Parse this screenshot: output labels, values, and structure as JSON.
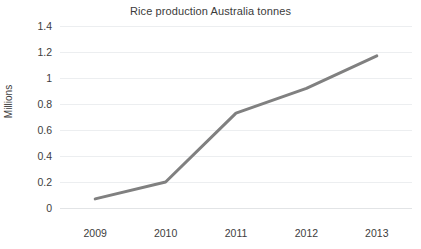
{
  "chart_data": {
    "type": "line",
    "title": "Rice production Australia tonnes",
    "xlabel": "",
    "ylabel": "Millions",
    "categories": [
      "2009",
      "2010",
      "2011",
      "2012",
      "2013"
    ],
    "values": [
      0.07,
      0.2,
      0.73,
      0.92,
      1.17
    ],
    "series": [
      {
        "name": "Rice production Australia tonnes",
        "values": [
          0.07,
          0.2,
          0.73,
          0.92,
          1.17
        ]
      }
    ],
    "ylim": [
      0,
      1.4
    ],
    "y_ticks": [
      "0",
      "0.2",
      "0.4",
      "0.6",
      "0.8",
      "1",
      "1.2",
      "1.4"
    ],
    "y_tick_values": [
      0,
      0.2,
      0.4,
      0.6,
      0.8,
      1,
      1.2,
      1.4
    ],
    "x_ticks": [
      "2009",
      "2010",
      "2011",
      "2012",
      "2013"
    ],
    "grid": "horizontal",
    "legend": "none",
    "line_color": "#808080",
    "grid_color": "#eceef0",
    "text_color": "#3d3d3d",
    "background_color": "#ffffff",
    "line_width": 3,
    "markers": "none"
  }
}
